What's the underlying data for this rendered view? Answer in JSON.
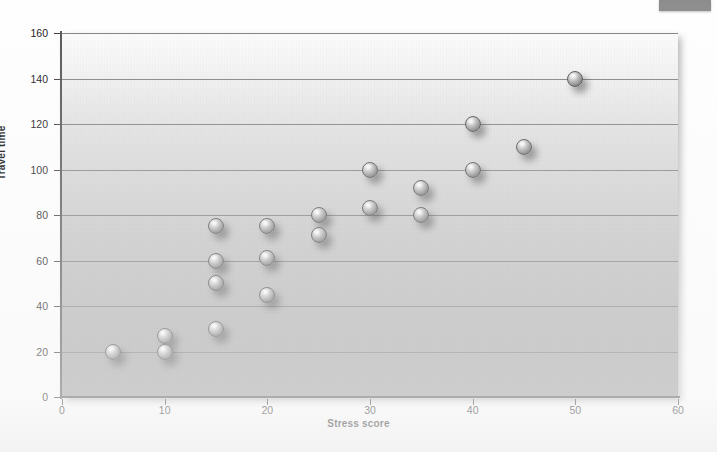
{
  "figure": {
    "corner_tab": "page-tab-artifact"
  },
  "chart_data": {
    "type": "scatter",
    "title": "",
    "xlabel": "Stress score",
    "ylabel": "Travel time",
    "xlim": [
      0,
      60
    ],
    "ylim": [
      0,
      160
    ],
    "xticks": [
      0,
      10,
      20,
      30,
      40,
      50,
      60
    ],
    "yticks": [
      0,
      20,
      40,
      60,
      80,
      100,
      120,
      140,
      160
    ],
    "grid": "horizontal",
    "legend": "none",
    "marker_style": "3d-sphere-gray",
    "series": [
      {
        "name": "observations",
        "points": [
          [
            5,
            20
          ],
          [
            10,
            27
          ],
          [
            10,
            20
          ],
          [
            15,
            30
          ],
          [
            15,
            75
          ],
          [
            15,
            60
          ],
          [
            15,
            50
          ],
          [
            20,
            75
          ],
          [
            20,
            61
          ],
          [
            20,
            45
          ],
          [
            25,
            80
          ],
          [
            25,
            71
          ],
          [
            30,
            100
          ],
          [
            30,
            83
          ],
          [
            35,
            92
          ],
          [
            35,
            80
          ],
          [
            40,
            120
          ],
          [
            40,
            100
          ],
          [
            45,
            110
          ],
          [
            50,
            140
          ]
        ]
      }
    ]
  },
  "colors": {
    "gridline": "#6f6f6f",
    "axis": "#545454",
    "marker_outline": "#4c4c4c",
    "text": "#111111"
  }
}
